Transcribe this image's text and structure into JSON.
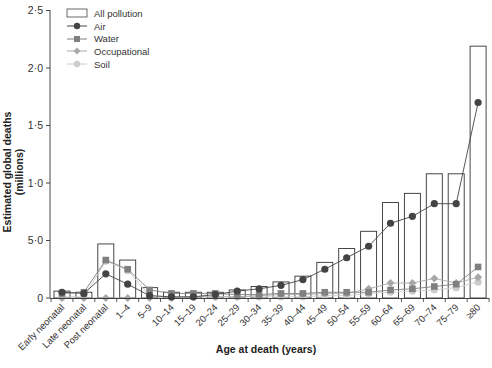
{
  "chart_data": {
    "type": "bar+line",
    "title": "",
    "xlabel": "Age at death (years)",
    "ylabel": "Estimated global deaths (millions)",
    "ylim": [
      0,
      2.5
    ],
    "yticks": [
      {
        "value": 0,
        "label": "0"
      },
      {
        "value": 0.5,
        "label": "5·0"
      },
      {
        "value": 1.0,
        "label": "1·0"
      },
      {
        "value": 1.5,
        "label": "1·5"
      },
      {
        "value": 2.0,
        "label": "2·0"
      },
      {
        "value": 2.5,
        "label": "2·5"
      }
    ],
    "grid": false,
    "legend_position": "top-left",
    "categories": [
      "Early neonatal",
      "Late neonatal",
      "Post neonatal",
      "1–4",
      "5–9",
      "10–14",
      "15–19",
      "20–24",
      "25–29",
      "30–34",
      "35–39",
      "40–44",
      "45–49",
      "50–54",
      "55–59",
      "60–64",
      "65–69",
      "70–74",
      "75–79",
      "≥80"
    ],
    "series": [
      {
        "name": "All pollution",
        "type": "bar",
        "color": "#ffffff",
        "stroke": "#333333",
        "values": [
          0.06,
          0.05,
          0.47,
          0.33,
          0.09,
          0.05,
          0.05,
          0.05,
          0.07,
          0.1,
          0.14,
          0.19,
          0.31,
          0.43,
          0.58,
          0.83,
          0.91,
          1.08,
          1.08,
          2.19
        ]
      },
      {
        "name": "Air",
        "type": "line",
        "marker": "circle",
        "color": "#444444",
        "values": [
          0.05,
          0.04,
          0.21,
          0.12,
          0.02,
          0.01,
          0.01,
          0.03,
          0.06,
          0.08,
          0.11,
          0.16,
          0.25,
          0.35,
          0.45,
          0.65,
          0.71,
          0.82,
          0.82,
          1.7
        ]
      },
      {
        "name": "Water",
        "type": "line",
        "marker": "square",
        "color": "#808080",
        "values": [
          0.04,
          0.05,
          0.33,
          0.25,
          0.07,
          0.04,
          0.04,
          0.04,
          0.03,
          0.03,
          0.04,
          0.04,
          0.05,
          0.05,
          0.05,
          0.07,
          0.08,
          0.1,
          0.12,
          0.27
        ]
      },
      {
        "name": "Occupational",
        "type": "line",
        "marker": "diamond",
        "color": "#a8a8a8",
        "values": [
          0.0,
          0.0,
          0.0,
          0.0,
          0.0,
          0.0,
          0.01,
          0.01,
          0.01,
          0.02,
          0.03,
          0.03,
          0.04,
          0.04,
          0.08,
          0.13,
          0.13,
          0.17,
          0.13,
          0.18
        ]
      },
      {
        "name": "Soil",
        "type": "line",
        "marker": "circle",
        "color": "#cccccc",
        "values": [
          0.01,
          0.01,
          0.32,
          0.24,
          0.02,
          0.01,
          0.01,
          0.01,
          0.01,
          0.01,
          0.01,
          0.01,
          0.02,
          0.02,
          0.04,
          0.05,
          0.06,
          0.07,
          0.09,
          0.14
        ]
      }
    ]
  },
  "legend": [
    {
      "label": "All pollution",
      "icon": "bar-swatch"
    },
    {
      "label": "Air",
      "icon": "circle-marker"
    },
    {
      "label": "Water",
      "icon": "square-marker"
    },
    {
      "label": "Occupational",
      "icon": "diamond-marker"
    },
    {
      "label": "Soil",
      "icon": "circle-marker"
    }
  ],
  "axis": {
    "xlabel": "Age at death (years)",
    "ylabel": "Estimated global deaths (millions)"
  }
}
